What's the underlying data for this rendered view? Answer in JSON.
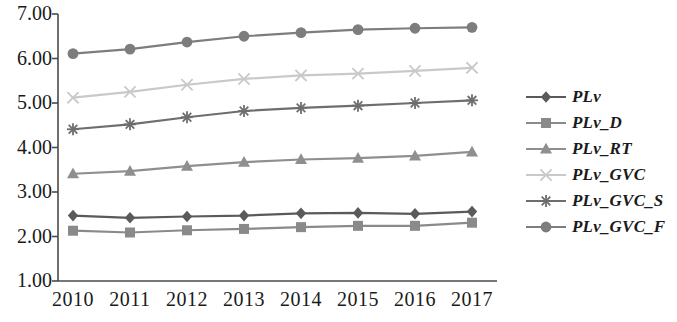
{
  "chart_data": {
    "type": "line",
    "title": "",
    "subtitle": "",
    "xlabel": "",
    "ylabel": "",
    "categories": [
      "2010",
      "2011",
      "2012",
      "2013",
      "2014",
      "2015",
      "2016",
      "2017"
    ],
    "x": [
      2010,
      2011,
      2012,
      2013,
      2014,
      2015,
      2016,
      2017
    ],
    "ylim": [
      1.0,
      7.0
    ],
    "ytick_labels": [
      "7.00",
      "6.00",
      "5.00",
      "4.00",
      "3.00",
      "2.00",
      "1.00"
    ],
    "ytick_values": [
      7.0,
      6.0,
      5.0,
      4.0,
      3.0,
      2.0,
      1.0
    ],
    "grid": false,
    "legend_position": "right",
    "series": [
      {
        "name": "PLv",
        "marker": "diamond",
        "color": "#5a5a5a",
        "values": [
          2.47,
          2.42,
          2.45,
          2.47,
          2.52,
          2.53,
          2.51,
          2.56
        ]
      },
      {
        "name": "PLv_D",
        "marker": "square",
        "color": "#8a8a8a",
        "values": [
          2.13,
          2.09,
          2.14,
          2.17,
          2.21,
          2.24,
          2.24,
          2.31
        ]
      },
      {
        "name": "PLv_RT",
        "marker": "triangle",
        "color": "#8f8f8f",
        "values": [
          3.41,
          3.47,
          3.58,
          3.67,
          3.73,
          3.76,
          3.81,
          3.9
        ]
      },
      {
        "name": "PLv_GVC",
        "marker": "x",
        "color": "#c9c9c9",
        "values": [
          5.12,
          5.25,
          5.41,
          5.54,
          5.62,
          5.66,
          5.72,
          5.79
        ]
      },
      {
        "name": "PLv_GVC_S",
        "marker": "asterisk",
        "color": "#6e6e6e",
        "values": [
          4.41,
          4.52,
          4.68,
          4.82,
          4.89,
          4.94,
          5.0,
          5.06
        ]
      },
      {
        "name": "PLv_GVC_F",
        "marker": "circle",
        "color": "#7d7d7d",
        "values": [
          6.11,
          6.21,
          6.37,
          6.5,
          6.58,
          6.65,
          6.68,
          6.7
        ]
      }
    ]
  },
  "axis": {
    "axis_color": "#4a4a4a"
  }
}
